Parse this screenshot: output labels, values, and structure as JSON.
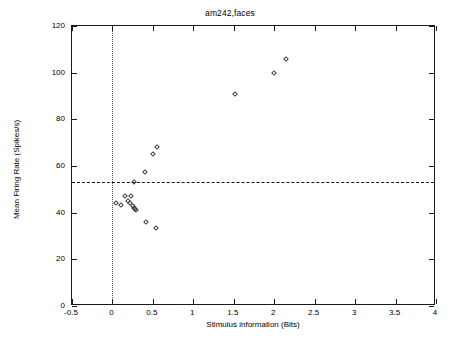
{
  "chart_data": {
    "type": "scatter",
    "title": "am242,faces",
    "xlabel": "Stimulus information (Bits)",
    "ylabel": "Mean Firing Rate (Spikes/s)",
    "xlim": [
      -0.5,
      4
    ],
    "ylim": [
      0,
      120
    ],
    "xticks": [
      -0.5,
      0,
      0.5,
      1,
      1.5,
      2,
      2.5,
      3,
      3.5,
      4
    ],
    "xticklabels": [
      "-0.5",
      "0",
      "0.5",
      "1",
      "1.5",
      "2",
      "2.5",
      "3",
      "3.5",
      "4"
    ],
    "yticks": [
      0,
      20,
      40,
      60,
      80,
      100,
      120
    ],
    "yticklabels": [
      "0",
      "20",
      "40",
      "60",
      "80",
      "100",
      "120"
    ],
    "grid": false,
    "legend": null,
    "marker": "open-diamond",
    "marker_color": "#3a3a3a",
    "reference_lines": [
      {
        "name": "baseline-firing-rate",
        "orientation": "horizontal",
        "value": 53,
        "style": "dashed"
      },
      {
        "name": "zero-information",
        "orientation": "vertical",
        "value": 0,
        "style": "dotted"
      }
    ],
    "x": [
      2.15,
      2.0,
      1.52,
      0.55,
      0.5,
      0.4,
      0.27,
      0.16,
      0.23,
      0.05,
      0.1,
      0.19,
      0.22,
      0.25,
      0.27,
      0.28,
      0.29,
      0.41,
      0.54
    ],
    "y": [
      106,
      100,
      91,
      68,
      65,
      57.5,
      53,
      47,
      47,
      44,
      43.5,
      45,
      44,
      43,
      42,
      41.5,
      41,
      36,
      33.5
    ],
    "points": [
      {
        "x": 2.15,
        "y": 106
      },
      {
        "x": 2.0,
        "y": 100
      },
      {
        "x": 1.52,
        "y": 91
      },
      {
        "x": 0.55,
        "y": 68
      },
      {
        "x": 0.5,
        "y": 65
      },
      {
        "x": 0.4,
        "y": 57.5
      },
      {
        "x": 0.27,
        "y": 53
      },
      {
        "x": 0.16,
        "y": 47
      },
      {
        "x": 0.23,
        "y": 47
      },
      {
        "x": 0.05,
        "y": 44
      },
      {
        "x": 0.1,
        "y": 43.5
      },
      {
        "x": 0.19,
        "y": 45
      },
      {
        "x": 0.22,
        "y": 44
      },
      {
        "x": 0.25,
        "y": 43
      },
      {
        "x": 0.27,
        "y": 42
      },
      {
        "x": 0.28,
        "y": 41.5
      },
      {
        "x": 0.29,
        "y": 41
      },
      {
        "x": 0.41,
        "y": 36
      },
      {
        "x": 0.54,
        "y": 33.5
      }
    ]
  }
}
